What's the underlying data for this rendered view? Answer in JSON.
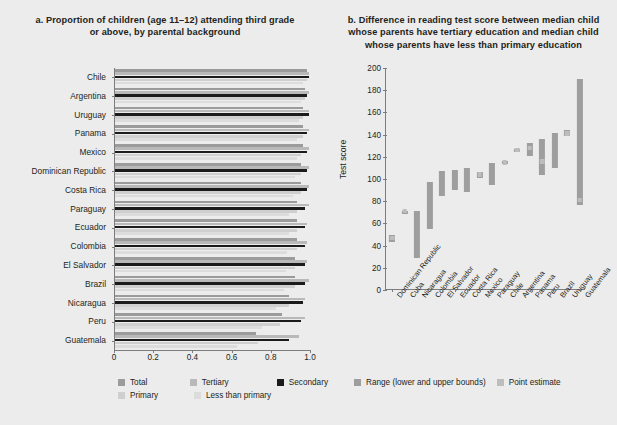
{
  "figure": {
    "background": "#ececec",
    "width": 617,
    "height": 425
  },
  "panel_a": {
    "label": "a.",
    "title": "a.  Proportion of children (age 11–12) attending third grade or above, by parental background",
    "title_line1": "a.  Proportion of children (age 11–12) attending third grade",
    "title_line2": "or above, by parental background",
    "legend": {
      "total": "Total",
      "tertiary": "Tertiary",
      "secondary": "Secondary",
      "primary": "Primary",
      "less_than_primary": "Less than primary"
    }
  },
  "panel_b": {
    "label": "b.",
    "title_line1": "b.  Difference in reading test score between median child",
    "title_line2": "whose parents have tertiary education and median child",
    "title_line3": "whose parents have less than primary education",
    "legend": {
      "range": "Range (lower and upper bounds)",
      "point": "Point estimate"
    }
  },
  "colors": {
    "total": "#9b9b9b",
    "tertiary": "#b9b9b9",
    "secondary": "#1b1b1b",
    "primary": "#cfcfcf",
    "less_than_primary": "#dcdcdc",
    "range": "#9e9e9e",
    "point": "#bdbdbd",
    "axis": "#7d7d7d",
    "text": "#231f20"
  },
  "chart_data": [
    {
      "id": "chart-a",
      "type": "bar",
      "orientation": "horizontal",
      "title": "a. Proportion of children (age 11–12) attending third grade or above, by parental background",
      "xlabel": "",
      "ylabel": "",
      "xlim": [
        0,
        1.0
      ],
      "xticks": [
        0,
        0.2,
        0.4,
        0.6,
        0.8,
        1.0
      ],
      "xticklabels": [
        "0",
        "0.2",
        "0.4",
        "0.6",
        "0.8",
        "1.0"
      ],
      "grid": false,
      "legend_position": "bottom",
      "categories": [
        "Chile",
        "Argentina",
        "Uruguay",
        "Panama",
        "Mexico",
        "Dominican Republic",
        "Costa Rica",
        "Paraguay",
        "Ecuador",
        "Colombia",
        "El Salvador",
        "Brazil",
        "Nicaragua",
        "Peru",
        "Guatemala"
      ],
      "series": [
        {
          "name": "Total",
          "color": "#9b9b9b",
          "values": [
            0.98,
            0.97,
            0.96,
            0.96,
            0.96,
            0.95,
            0.95,
            0.93,
            0.93,
            0.93,
            0.92,
            0.92,
            0.89,
            0.85,
            0.72
          ]
        },
        {
          "name": "Tertiary",
          "color": "#b9b9b9",
          "values": [
            0.99,
            0.99,
            0.99,
            0.99,
            0.99,
            0.99,
            0.99,
            0.99,
            0.98,
            0.98,
            0.98,
            0.99,
            0.97,
            0.97,
            0.94
          ]
        },
        {
          "name": "Secondary",
          "color": "#1b1b1b",
          "values": [
            0.99,
            0.98,
            0.99,
            0.98,
            0.98,
            0.98,
            0.98,
            0.97,
            0.97,
            0.97,
            0.97,
            0.97,
            0.96,
            0.95,
            0.89
          ]
        },
        {
          "name": "Primary",
          "color": "#cfcfcf",
          "values": [
            0.98,
            0.97,
            0.96,
            0.96,
            0.95,
            0.95,
            0.95,
            0.93,
            0.93,
            0.93,
            0.92,
            0.92,
            0.89,
            0.84,
            0.73
          ]
        },
        {
          "name": "Less than primary",
          "color": "#dcdcdc",
          "values": [
            0.96,
            0.95,
            0.94,
            0.93,
            0.93,
            0.92,
            0.91,
            0.89,
            0.89,
            0.88,
            0.87,
            0.86,
            0.82,
            0.75,
            0.62
          ]
        }
      ]
    },
    {
      "id": "chart-b",
      "type": "range",
      "title": "b. Difference in reading test score between median child whose parents have tertiary education and median child whose parents have less than primary education",
      "xlabel": "",
      "ylabel": "Test score",
      "ylim": [
        0,
        200
      ],
      "yticks": [
        0,
        20,
        40,
        60,
        80,
        100,
        120,
        140,
        160,
        180,
        200
      ],
      "yticklabels": [
        "0",
        "20",
        "40",
        "60",
        "80",
        "100",
        "120",
        "140",
        "160",
        "180",
        "200"
      ],
      "grid": false,
      "legend_position": "bottom",
      "categories": [
        "Dominican Republic",
        "Cuba",
        "Nicaragua",
        "Colombia",
        "El Salvador",
        "Ecuador",
        "Costa Rica",
        "Mexico",
        "Paraguay",
        "Chile",
        "Argentina",
        "Panama",
        "Peru",
        "Brazil",
        "Uruguay",
        "Guatemala"
      ],
      "lower": [
        43,
        71,
        29,
        55,
        85,
        90,
        88,
        101,
        95,
        114,
        124,
        121,
        104,
        110,
        139,
        77
      ],
      "upper": [
        50,
        71,
        71,
        97,
        107,
        108,
        110,
        106,
        114,
        116,
        127,
        132,
        136,
        141,
        144,
        190
      ],
      "point_estimate": [
        47,
        71,
        null,
        null,
        null,
        null,
        null,
        104,
        null,
        115,
        126,
        128,
        116,
        null,
        141,
        81
      ]
    }
  ]
}
